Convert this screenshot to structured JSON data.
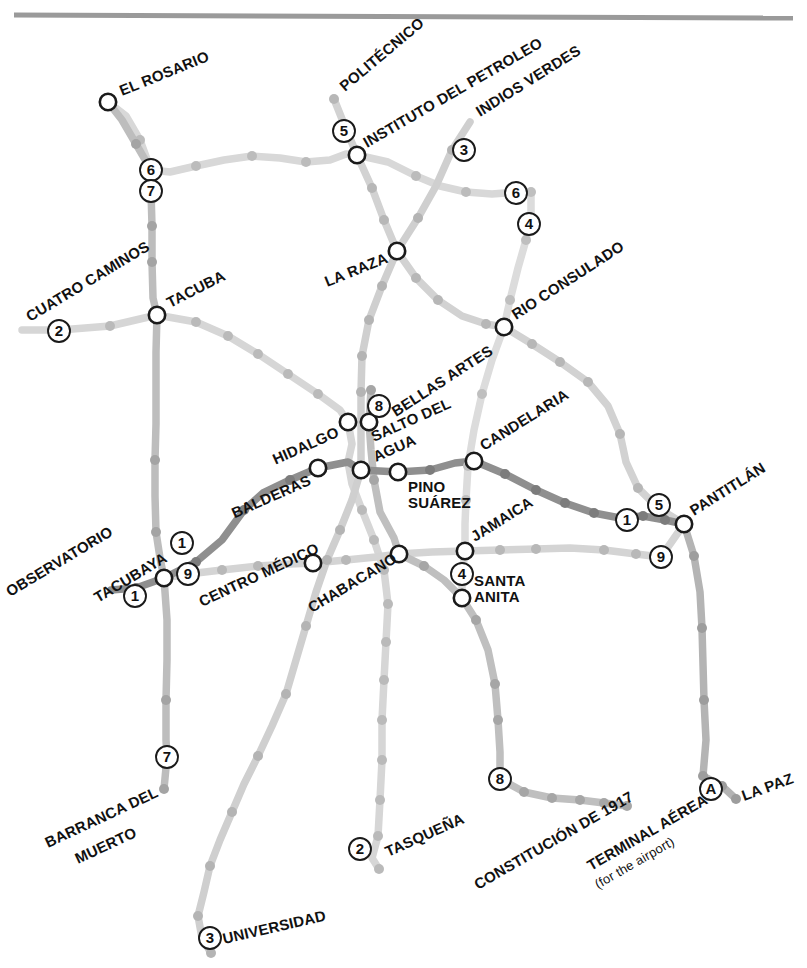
{
  "map": {
    "title": "Mexico City Metro",
    "width": 807,
    "height": 968,
    "background": "#ffffff",
    "top_rule_color": "#9a9a9a"
  },
  "lines": [
    {
      "id": "1",
      "label": "1",
      "color": "#8f8f8f",
      "stroke": 7.5
    },
    {
      "id": "2",
      "label": "2",
      "color": "#d6d6d6",
      "stroke": 7.5
    },
    {
      "id": "3",
      "label": "3",
      "color": "#cfcfcf",
      "stroke": 7.5
    },
    {
      "id": "4",
      "label": "4",
      "color": "#dcdcdc",
      "stroke": 7.5
    },
    {
      "id": "5",
      "label": "5",
      "color": "#d2d2d2",
      "stroke": 7.5
    },
    {
      "id": "6",
      "label": "6",
      "color": "#d8d8d8",
      "stroke": 7.5
    },
    {
      "id": "7",
      "label": "7",
      "color": "#bdbdbd",
      "stroke": 7.5
    },
    {
      "id": "8",
      "label": "8",
      "color": "#bfbfbf",
      "stroke": 7.5
    },
    {
      "id": "9",
      "label": "9",
      "color": "#d4d4d4",
      "stroke": 7.5
    },
    {
      "id": "A",
      "label": "A",
      "color": "#b4b4b4",
      "stroke": 7.5
    }
  ],
  "line_bullets": [
    {
      "label": "6",
      "x": 151,
      "y": 170
    },
    {
      "label": "7",
      "x": 151,
      "y": 191
    },
    {
      "label": "2",
      "x": 59,
      "y": 331
    },
    {
      "label": "5",
      "x": 344,
      "y": 131
    },
    {
      "label": "3",
      "x": 464,
      "y": 150
    },
    {
      "label": "6",
      "x": 516,
      "y": 193
    },
    {
      "label": "4",
      "x": 529,
      "y": 224
    },
    {
      "label": "8",
      "x": 379,
      "y": 406
    },
    {
      "label": "1",
      "x": 182,
      "y": 543
    },
    {
      "label": "9",
      "x": 188,
      "y": 574
    },
    {
      "label": "1",
      "x": 135,
      "y": 596
    },
    {
      "label": "1",
      "x": 627,
      "y": 520
    },
    {
      "label": "5",
      "x": 659,
      "y": 505
    },
    {
      "label": "9",
      "x": 661,
      "y": 557
    },
    {
      "label": "4",
      "x": 462,
      "y": 574
    },
    {
      "label": "7",
      "x": 167,
      "y": 757
    },
    {
      "label": "2",
      "x": 360,
      "y": 849
    },
    {
      "label": "3",
      "x": 210,
      "y": 938
    },
    {
      "label": "8",
      "x": 500,
      "y": 779
    },
    {
      "label": "A",
      "x": 711,
      "y": 789
    }
  ],
  "stations": [
    {
      "name": "EL ROSARIO",
      "x": 108,
      "y": 102,
      "label_x": 122,
      "label_y": 96,
      "rot": -22,
      "anchor": "start",
      "size": 15,
      "transfer": true
    },
    {
      "name": "POLITÉCNICO",
      "x": 334,
      "y": 99,
      "label_x": 345,
      "label_y": 92,
      "rot": -40,
      "anchor": "start",
      "size": 15,
      "transfer": false
    },
    {
      "name": "INSTITUTO DEL PETROLEO",
      "x": 357,
      "y": 155,
      "label_x": 367,
      "label_y": 148,
      "rot": -30,
      "anchor": "start",
      "size": 15,
      "transfer": true
    },
    {
      "name": "INDIOS VERDES",
      "x": 470,
      "y": 122,
      "label_x": 480,
      "label_y": 117,
      "rot": -32,
      "anchor": "start",
      "size": 15,
      "transfer": false
    },
    {
      "name": "RIO CONSULADO",
      "x": 504,
      "y": 327,
      "label_x": 516,
      "label_y": 320,
      "rot": -33,
      "anchor": "start",
      "size": 15,
      "transfer": true
    },
    {
      "name": "LA RAZA",
      "x": 397,
      "y": 251,
      "label_x": 389,
      "label_y": 262,
      "rot": -22,
      "anchor": "end",
      "size": 15,
      "transfer": true
    },
    {
      "name": "CUATRO CAMINOS",
      "x": 21,
      "y": 330,
      "label_x": 30,
      "label_y": 322,
      "rot": -31,
      "anchor": "start",
      "size": 15,
      "transfer": false
    },
    {
      "name": "TACUBA",
      "x": 157,
      "y": 315,
      "label_x": 170,
      "label_y": 308,
      "rot": -27,
      "anchor": "start",
      "size": 15,
      "transfer": true
    },
    {
      "name": "BELLAS ARTES",
      "x": 369,
      "y": 422,
      "label_x": 396,
      "label_y": 417,
      "rot": -33,
      "anchor": "start",
      "size": 15,
      "transfer": true
    },
    {
      "name": "CANDELARIA",
      "x": 474,
      "y": 461,
      "label_x": 484,
      "label_y": 451,
      "rot": -32,
      "anchor": "start",
      "size": 15,
      "transfer": true
    },
    {
      "name": "HIDALGO",
      "x": 348,
      "y": 422,
      "label_x": 340,
      "label_y": 436,
      "rot": -24,
      "anchor": "end",
      "size": 15,
      "transfer": true
    },
    {
      "name": "SALTO DEL",
      "x": 361,
      "y": 470,
      "label_x": 374,
      "label_y": 442,
      "rot": -24,
      "anchor": "start",
      "size": 15,
      "transfer": true
    },
    {
      "name": "AGUA",
      "x": -1,
      "y": -1,
      "label_x": 376,
      "label_y": 462,
      "rot": -24,
      "anchor": "start",
      "size": 15,
      "transfer": false
    },
    {
      "name": "BALDERAS",
      "x": 318,
      "y": 468,
      "label_x": 312,
      "label_y": 484,
      "rot": -24,
      "anchor": "end",
      "size": 15,
      "transfer": true
    },
    {
      "name": "PINO",
      "x": 398,
      "y": 472,
      "label_x": 408,
      "label_y": 492,
      "rot": 0,
      "anchor": "start",
      "size": 15,
      "transfer": true
    },
    {
      "name": "SUÁREZ",
      "x": -1,
      "y": -1,
      "label_x": 408,
      "label_y": 508,
      "rot": 0,
      "anchor": "start",
      "size": 15,
      "transfer": false
    },
    {
      "name": "JAMAICA",
      "x": 465,
      "y": 551,
      "label_x": 475,
      "label_y": 542,
      "rot": -32,
      "anchor": "start",
      "size": 15,
      "transfer": true
    },
    {
      "name": "SANTA",
      "x": 462,
      "y": 598,
      "label_x": 474,
      "label_y": 586,
      "rot": 0,
      "anchor": "start",
      "size": 15,
      "transfer": true
    },
    {
      "name": "ANITA",
      "x": -1,
      "y": -1,
      "label_x": 474,
      "label_y": 602,
      "rot": 0,
      "anchor": "start",
      "size": 15,
      "transfer": false
    },
    {
      "name": "PANTITLÁN",
      "x": 684,
      "y": 524,
      "label_x": 694,
      "label_y": 516,
      "rot": -32,
      "anchor": "start",
      "size": 15,
      "transfer": true
    },
    {
      "name": "OBSERVATORIO",
      "x": 111,
      "y": 590,
      "label_x": 10,
      "label_y": 597,
      "rot": -31,
      "anchor": "start",
      "size": 15,
      "transfer": false
    },
    {
      "name": "TACUBAYA",
      "x": 164,
      "y": 578,
      "label_x": 98,
      "label_y": 603,
      "rot": -31,
      "anchor": "start",
      "size": 15,
      "transfer": true
    },
    {
      "name": "CENTRO MÉDICO",
      "x": 313,
      "y": 563,
      "label_x": 202,
      "label_y": 607,
      "rot": -25,
      "anchor": "start",
      "size": 15,
      "transfer": true
    },
    {
      "name": "CHABACANO",
      "x": 399,
      "y": 554,
      "label_x": 312,
      "label_y": 613,
      "rot": -31,
      "anchor": "start",
      "size": 15,
      "transfer": true
    },
    {
      "name": "BARRANCA DEL",
      "x": 164,
      "y": 789,
      "label_x": 48,
      "label_y": 848,
      "rot": -25,
      "anchor": "start",
      "size": 15,
      "transfer": false
    },
    {
      "name": "MUERTO",
      "x": -1,
      "y": -1,
      "label_x": 78,
      "label_y": 864,
      "rot": -25,
      "anchor": "start",
      "size": 15,
      "transfer": false
    },
    {
      "name": "TASQUEÑA",
      "x": 379,
      "y": 869,
      "label_x": 388,
      "label_y": 857,
      "rot": -24,
      "anchor": "start",
      "size": 15,
      "transfer": false
    },
    {
      "name": "UNIVERSIDAD",
      "x": 211,
      "y": 953,
      "label_x": 224,
      "label_y": 944,
      "rot": -13,
      "anchor": "start",
      "size": 15,
      "transfer": false
    },
    {
      "name": "CONSTITUCIÓN DE 1917",
      "x": 627,
      "y": 806,
      "label_x": 478,
      "label_y": 890,
      "rot": -30,
      "anchor": "start",
      "size": 15,
      "transfer": false
    },
    {
      "name": "TERMINAL AÉREA",
      "x": 703,
      "y": 776,
      "label_x": 591,
      "label_y": 871,
      "rot": -30,
      "anchor": "start",
      "size": 15,
      "transfer": false
    },
    {
      "name": "(for the airport)",
      "x": -1,
      "y": -1,
      "label_x": 598,
      "label_y": 889,
      "rot": -30,
      "anchor": "start",
      "size": 13,
      "transfer": false
    },
    {
      "name": "LA PAZ",
      "x": 736,
      "y": 799,
      "label_x": 744,
      "label_y": 801,
      "rot": -20,
      "anchor": "start",
      "size": 15,
      "transfer": false
    }
  ],
  "routes": {
    "line1": "M 111 590 L 136 588 L 164 578 L 196 562 L 222 540 L 244 510 L 263 493 L 290 480 L 318 468 L 348 462 L 361 470 L 398 472 L 430 470 L 455 463 L 474 461 L 505 474 L 536 490 L 565 503 L 594 513 L 620 518 L 643 516 L 665 520 L 684 524",
    "line2": "M 22 330 L 60 330 L 110 326 L 157 315 L 196 322 L 228 336 L 258 354 L 288 374 L 318 394 L 340 410 L 348 422 L 352 444 L 348 462 L 352 484 L 362 510 L 374 540 L 384 570 L 388 604 L 386 642 L 384 680 L 382 720 L 382 760 L 380 800 L 378 836 L 372 858 L 379 869",
    "line3": "M 470 122 L 452 150 L 436 186 L 418 218 L 397 251 L 382 286 L 369 320 L 362 356 L 361 392 L 361 428 L 361 470 L 352 500 L 340 530 L 327 560 L 316 592 L 306 626 L 296 660 L 286 694 L 272 726 L 258 756 L 244 784 L 232 812 L 220 840 L 210 866 L 204 892 L 198 916 L 202 938 L 211 953",
    "line4": "M 531 192 L 531 214 L 526 240 L 518 268 L 510 300 L 504 327 L 492 360 L 482 394 L 474 430 L 468 466 L 466 500 L 465 524 L 465 551 L 462 576 L 462 598",
    "line5": "M 334 99 L 344 124 L 357 155 L 372 188 L 384 220 L 397 251 L 416 278 L 438 300 L 462 316 L 486 324 L 504 327 L 532 344 L 560 362 L 588 382 L 608 406 L 620 434 L 626 462 L 638 488 L 658 508 L 684 524",
    "line6": "M 108 102 L 126 116 L 140 140 L 151 170 L 170 172 L 196 166 L 224 160 L 252 156 L 280 158 L 306 162 L 330 160 L 346 154 L 357 155 L 388 162 L 416 176 L 440 186 L 466 192 L 492 194 L 518 192 L 531 192",
    "line7": "M 108 102 L 122 120 L 136 144 L 151 170 L 151 191 L 152 226 L 152 262 L 153 298 L 157 315 L 156 352 L 156 388 L 156 424 L 155 460 L 155 496 L 156 532 L 160 558 L 164 578 L 167 620 L 167 660 L 166 700 L 166 740 L 167 757 L 164 789",
    "line8": "M 371 390 L 369 422 L 371 450 L 374 480 L 380 512 L 394 538 L 399 554 L 424 566 L 444 580 L 462 598 L 476 620 L 488 650 L 495 684 L 498 720 L 500 752 L 500 779 L 524 792 L 552 798 L 580 800 L 604 803 L 627 806",
    "line9": "M 164 578 L 188 574 L 222 570 L 258 566 L 290 564 L 313 563 L 346 560 L 376 557 L 399 554 L 432 552 L 465 551 L 500 550 L 536 549 L 570 548 L 604 550 L 636 554 L 661 557 L 684 524",
    "lineA": "M 684 524 L 694 556 L 700 592 L 702 628 L 703 664 L 704 700 L 706 740 L 703 776 L 722 786 L 736 799",
    "pantitlan_tail": "M 684 524 L 692 560 L 698 600"
  },
  "dots": {
    "line1": [
      [
        136,
        588
      ],
      [
        196,
        562
      ],
      [
        244,
        510
      ],
      [
        290,
        480
      ],
      [
        430,
        470
      ],
      [
        505,
        474
      ],
      [
        536,
        490
      ],
      [
        565,
        503
      ],
      [
        594,
        513
      ],
      [
        643,
        516
      ],
      [
        665,
        520
      ]
    ],
    "line2": [
      [
        60,
        330
      ],
      [
        110,
        326
      ],
      [
        196,
        322
      ],
      [
        228,
        336
      ],
      [
        258,
        354
      ],
      [
        288,
        374
      ],
      [
        318,
        394
      ],
      [
        362,
        510
      ],
      [
        374,
        540
      ],
      [
        384,
        570
      ],
      [
        388,
        604
      ],
      [
        386,
        642
      ],
      [
        384,
        680
      ],
      [
        382,
        720
      ],
      [
        382,
        760
      ],
      [
        380,
        800
      ],
      [
        378,
        836
      ],
      [
        379,
        869
      ]
    ],
    "line3": [
      [
        452,
        150
      ],
      [
        418,
        218
      ],
      [
        382,
        286
      ],
      [
        369,
        320
      ],
      [
        362,
        356
      ],
      [
        361,
        392
      ],
      [
        340,
        530
      ],
      [
        327,
        560
      ],
      [
        306,
        626
      ],
      [
        286,
        694
      ],
      [
        258,
        756
      ],
      [
        232,
        812
      ],
      [
        210,
        866
      ],
      [
        198,
        916
      ],
      [
        211,
        953
      ]
    ],
    "line4": [
      [
        531,
        192
      ],
      [
        526,
        240
      ],
      [
        510,
        300
      ],
      [
        482,
        394
      ],
      [
        468,
        466
      ],
      [
        466,
        500
      ]
    ],
    "line5": [
      [
        334,
        99
      ],
      [
        372,
        188
      ],
      [
        384,
        220
      ],
      [
        416,
        278
      ],
      [
        438,
        300
      ],
      [
        486,
        324
      ],
      [
        532,
        344
      ],
      [
        560,
        362
      ],
      [
        588,
        382
      ],
      [
        620,
        434
      ],
      [
        638,
        488
      ]
    ],
    "line6": [
      [
        140,
        140
      ],
      [
        196,
        166
      ],
      [
        252,
        156
      ],
      [
        306,
        162
      ],
      [
        416,
        176
      ],
      [
        466,
        192
      ],
      [
        518,
        192
      ]
    ],
    "line7": [
      [
        136,
        144
      ],
      [
        152,
        226
      ],
      [
        152,
        262
      ],
      [
        155,
        460
      ],
      [
        156,
        532
      ],
      [
        166,
        700
      ],
      [
        164,
        789
      ]
    ],
    "line8": [
      [
        371,
        390
      ],
      [
        374,
        480
      ],
      [
        424,
        566
      ],
      [
        476,
        620
      ],
      [
        495,
        684
      ],
      [
        498,
        720
      ],
      [
        524,
        792
      ],
      [
        552,
        798
      ],
      [
        580,
        800
      ],
      [
        604,
        803
      ],
      [
        627,
        806
      ]
    ],
    "line9": [
      [
        222,
        570
      ],
      [
        258,
        566
      ],
      [
        346,
        560
      ],
      [
        500,
        550
      ],
      [
        536,
        549
      ],
      [
        604,
        550
      ],
      [
        636,
        554
      ]
    ],
    "lineA": [
      [
        694,
        556
      ],
      [
        702,
        628
      ],
      [
        704,
        700
      ],
      [
        703,
        776
      ],
      [
        722,
        786
      ],
      [
        736,
        799
      ]
    ]
  }
}
